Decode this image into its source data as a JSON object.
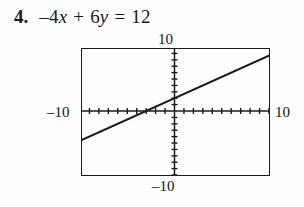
{
  "problem": {
    "number": "4.",
    "equation": {
      "full_text": "-4x + 6y = 12",
      "coef_x": "–4",
      "var_x": "x",
      "operator": "+",
      "coef_y": "6",
      "var_y": "y",
      "equals": "=",
      "constant": "12"
    }
  },
  "chart_data": {
    "type": "line",
    "title": "",
    "xlabel": "",
    "ylabel": "",
    "xlim": [
      -10,
      10
    ],
    "ylim": [
      -10,
      10
    ],
    "grid": false,
    "legend": null,
    "axis_labels": {
      "top": "10",
      "bottom": "–10",
      "left": "–10",
      "right": "10"
    },
    "tick_interval": 1,
    "x_tick_count": 20,
    "y_tick_count": 20,
    "series": [
      {
        "name": "-4x + 6y = 12",
        "equation_slope_intercept": "y = (2/3)x + 2",
        "slope": 0.6667,
        "intercept": 2,
        "x_intercept": -3,
        "y_intercept": 2,
        "x": [
          -10,
          10
        ],
        "y": [
          -4.667,
          8.667
        ],
        "style": "solid",
        "color": "#1b1b1b"
      }
    ]
  },
  "colors": {
    "ink": "#1b1b1b",
    "paper": "#fdfdfd"
  }
}
